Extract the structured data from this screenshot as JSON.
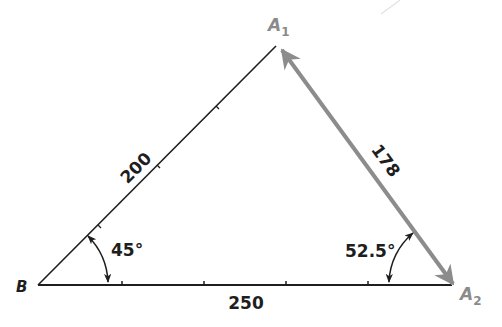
{
  "diagram": {
    "colors": {
      "line": "#1e1e1e",
      "vector": "#8c8c8c",
      "vector_label": "#8a8a8a",
      "background": "#ffffff"
    },
    "vertices": {
      "B": {
        "label": "B",
        "x": 38,
        "y": 285
      },
      "A1": {
        "label": "A",
        "subscript": "1",
        "x": 277,
        "y": 45
      },
      "A2": {
        "label": "A",
        "subscript": "2",
        "x": 455,
        "y": 285
      }
    },
    "sides": {
      "BA1": {
        "label": "200"
      },
      "BA2": {
        "label": "250"
      },
      "A1A2": {
        "label": "178"
      }
    },
    "angles": {
      "at_B": {
        "label": "45°"
      },
      "at_A2": {
        "label": "52.5°"
      }
    }
  }
}
